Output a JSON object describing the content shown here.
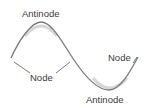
{
  "diagram": {
    "type": "standing-wave",
    "labels": {
      "antinode_top": "Antinode",
      "node_left": "Node",
      "node_right": "Node",
      "antinode_bottom": "Antinode"
    },
    "colors": {
      "wave": "#7a7a7a",
      "wave_shadow": "#c8c8c8",
      "text": "#3a3a3a",
      "leader": "#5a5a5a",
      "background": "#ffffff"
    }
  }
}
